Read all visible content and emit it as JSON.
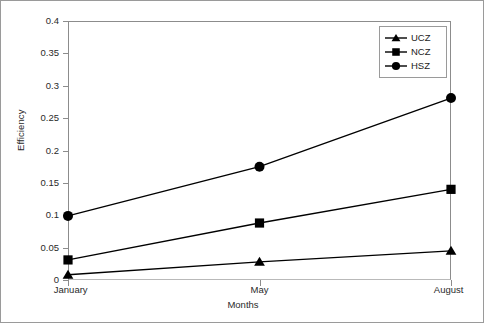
{
  "chart_data": {
    "type": "line",
    "title": "",
    "xlabel": "Months",
    "ylabel": "Efficiency",
    "categories": [
      "January",
      "May",
      "August"
    ],
    "x_tick_labels": [
      "January",
      "May",
      "August"
    ],
    "y_tick_labels": [
      "0",
      "0.05",
      "0.1",
      "0.15",
      "0.2",
      "0.25",
      "0.3",
      "0.35",
      "0.4"
    ],
    "y_tick_values": [
      0,
      0.05,
      0.1,
      0.15,
      0.2,
      0.25,
      0.3,
      0.35,
      0.4
    ],
    "ylim": [
      0,
      0.4
    ],
    "grid": false,
    "legend_position": "top-right",
    "series": [
      {
        "name": "UCZ",
        "marker": "triangle",
        "color": "#000000",
        "values": [
          0.008,
          0.028,
          0.045
        ]
      },
      {
        "name": "NCZ",
        "marker": "square",
        "color": "#000000",
        "values": [
          0.031,
          0.088,
          0.14
        ]
      },
      {
        "name": "HSZ",
        "marker": "circle",
        "color": "#000000",
        "values": [
          0.099,
          0.175,
          0.281
        ]
      }
    ]
  },
  "legend": {
    "entries": [
      {
        "label": "UCZ",
        "marker": "triangle-marker-icon"
      },
      {
        "label": "NCZ",
        "marker": "square-marker-icon"
      },
      {
        "label": "HSZ",
        "marker": "circle-marker-icon"
      }
    ]
  },
  "axes": {
    "y_title": "Efficiency",
    "x_title": "Months"
  }
}
